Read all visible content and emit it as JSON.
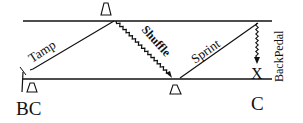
{
  "diagram": {
    "segments": [
      {
        "label": "Tamp",
        "style": "solid"
      },
      {
        "label": "Shuffle",
        "style": "zigzag"
      },
      {
        "label": "Sprint",
        "style": "solid"
      },
      {
        "label": "BackPedal",
        "style": "zigzag-arrow"
      }
    ],
    "markers": [
      {
        "name": "cone-top"
      },
      {
        "name": "cone-bottom-left"
      },
      {
        "name": "cone-bottom-middle"
      },
      {
        "name": "end-x",
        "label": "X"
      }
    ],
    "corner_labels": {
      "left": "BC",
      "right": "C"
    },
    "colors": {
      "stroke": "#111111",
      "background": "#ffffff"
    }
  }
}
